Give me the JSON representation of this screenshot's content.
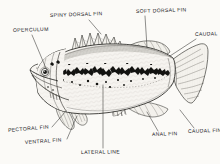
{
  "figure": {
    "style": "pen-and-ink line drawing, hand lettered labels",
    "background_color": "#fbfaf7",
    "ink_color": "#20201e",
    "width": 220,
    "height": 164
  },
  "labels": [
    {
      "id": "spiny-dorsal-fin",
      "text": "SPINY DORSAL FIN",
      "x": 50,
      "y": 16,
      "rotate": -2,
      "leader": {
        "x1": 89,
        "y1": 20,
        "x2": 101,
        "y2": 34
      }
    },
    {
      "id": "soft-dorsal-fin",
      "text": "SOFT DORSAL FIN",
      "x": 136,
      "y": 12,
      "rotate": -2,
      "leader": {
        "x1": 145,
        "y1": 16,
        "x2": 147,
        "y2": 47
      }
    },
    {
      "id": "operculum",
      "text": "OPERCULUM",
      "x": 13,
      "y": 31,
      "rotate": -2,
      "leader": {
        "x1": 32,
        "y1": 35,
        "x2": 48,
        "y2": 73
      }
    },
    {
      "id": "caudal-peduncle",
      "text": "CAUDAL",
      "x": 197,
      "y": 35,
      "rotate": -2,
      "leader": {
        "x1": 196,
        "y1": 39,
        "x2": 170,
        "y2": 56
      }
    },
    {
      "id": "caudal-fin",
      "text": "CAUDAL FIN",
      "x": 192,
      "y": 131,
      "rotate": -2,
      "leader": {
        "x1": 194,
        "y1": 128,
        "x2": 180,
        "y2": 110
      }
    },
    {
      "id": "anal-fin",
      "text": "ANAL FIN",
      "x": 155,
      "y": 134,
      "rotate": -2,
      "leader": {
        "x1": 158,
        "y1": 131,
        "x2": 147,
        "y2": 112
      }
    },
    {
      "id": "lateral-line",
      "text": "LATERAL LINE",
      "x": 82,
      "y": 152,
      "rotate": -1,
      "leader": {
        "x1": 103,
        "y1": 148,
        "x2": 103,
        "y2": 85
      }
    },
    {
      "id": "pectoral-fin",
      "text": "PECTORAL FIN",
      "x": 9,
      "y": 130,
      "rotate": -5,
      "leader": {
        "x1": 52,
        "y1": 127,
        "x2": 66,
        "y2": 111
      }
    },
    {
      "id": "ventral-fin",
      "text": "VENTRAL FIN",
      "x": 26,
      "y": 142,
      "rotate": -4,
      "leader": {
        "x1": 67,
        "y1": 139,
        "x2": 77,
        "y2": 116
      }
    }
  ],
  "anatomy_parts": [
    "body",
    "head",
    "eye",
    "mouth",
    "operculum",
    "spiny-dorsal-fin",
    "soft-dorsal-fin",
    "caudal-fin",
    "anal-fin",
    "ventral-fin",
    "pectoral-fin",
    "lateral-band",
    "lateral-line"
  ]
}
